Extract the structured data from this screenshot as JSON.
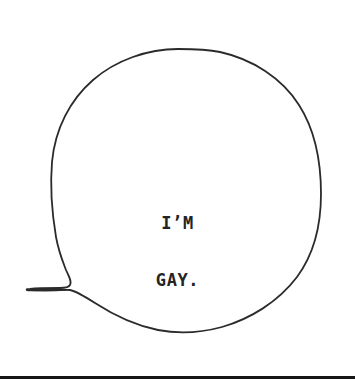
{
  "panel": {
    "width": 355,
    "height": 388,
    "background_color": "#ffffff",
    "ink_color": "#2b2b2b",
    "rule_color": "#161616"
  },
  "speech_balloon": {
    "name": "speech-balloon",
    "shape": "hand-drawn oval with pointed tail to the left",
    "stroke_color": "#2b2b2b",
    "stroke_width": 1.8,
    "fill": "none",
    "bounds": {
      "left": 51,
      "top": 49,
      "right": 321,
      "bottom": 333
    },
    "tail": {
      "direction": "left",
      "tip_x": 27,
      "tip_y": 289,
      "junction_x": 68,
      "junction_y": 287
    },
    "text": {
      "lines": [
        "I’M",
        "GAY."
      ],
      "line1": "I’M",
      "line2": "GAY.",
      "color": "#242424",
      "align": "center"
    }
  },
  "bottom_rule": {
    "name": "bottom-rule",
    "color": "#161616",
    "thickness": 3,
    "y": 377
  }
}
